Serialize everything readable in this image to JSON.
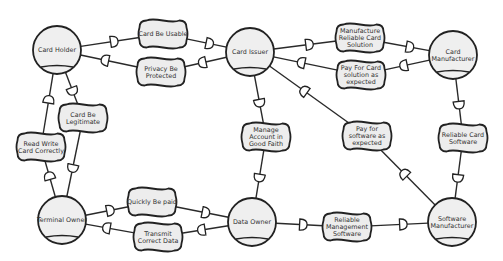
{
  "diagram": {
    "type": "i* Strategic Dependency Model",
    "actors": [
      {
        "id": "card_holder",
        "label": "Card Holder",
        "cx": 57,
        "cy": 50
      },
      {
        "id": "card_issuer",
        "label": "Card Issuer",
        "cx": 250,
        "cy": 52
      },
      {
        "id": "card_manufacturer",
        "label": [
          "Card",
          "Manufacturer"
        ],
        "cx": 453,
        "cy": 55
      },
      {
        "id": "terminal_owner",
        "label": "Terminal Owner",
        "cx": 62,
        "cy": 220
      },
      {
        "id": "data_owner",
        "label": "Data Owner",
        "cx": 252,
        "cy": 222
      },
      {
        "id": "software_manufacturer",
        "label": [
          "Software",
          "Manufacturer"
        ],
        "cx": 452,
        "cy": 222
      }
    ],
    "goals": [
      {
        "id": "card_be_usable",
        "label": [
          "Card Be Usable"
        ],
        "cx": 163,
        "cy": 34
      },
      {
        "id": "privacy_be_protected",
        "label": [
          "Privacy Be",
          "Protected"
        ],
        "cx": 161,
        "cy": 72
      },
      {
        "id": "manufacture_reliable_card_solution",
        "label": [
          "Manufacture",
          "Reliable Card",
          "Solution"
        ],
        "cx": 360,
        "cy": 38
      },
      {
        "id": "pay_for_card_solution",
        "label": [
          "Pay For Card",
          "solution as",
          "expected"
        ],
        "cx": 361,
        "cy": 75
      },
      {
        "id": "card_be_legitimate",
        "label": [
          "Card Be",
          "Legitimate"
        ],
        "cx": 83,
        "cy": 118
      },
      {
        "id": "read_write_card_correctly",
        "label": [
          "Read Write",
          "Card Correctly"
        ],
        "cx": 41,
        "cy": 147
      },
      {
        "id": "manage_account_good_faith",
        "label": [
          "Manage",
          "Account in",
          "Good Faith"
        ],
        "cx": 266,
        "cy": 137
      },
      {
        "id": "pay_for_software",
        "label": [
          "Pay for",
          "software as",
          "expected"
        ],
        "cx": 367,
        "cy": 136
      },
      {
        "id": "reliable_card_software",
        "label": [
          "Reliable Card",
          "Software"
        ],
        "cx": 463,
        "cy": 138
      },
      {
        "id": "quickly_be_paid",
        "label": [
          "Quickly Be paid"
        ],
        "cx": 152,
        "cy": 202
      },
      {
        "id": "transmit_correct_data",
        "label": [
          "Transmit",
          "Correct Data"
        ],
        "cx": 158,
        "cy": 237
      },
      {
        "id": "reliable_management_software",
        "label": [
          "Reliable",
          "Management",
          "Software"
        ],
        "cx": 347,
        "cy": 227
      }
    ],
    "dependencies": [
      {
        "depender": "card_holder",
        "dependum": "card_be_usable",
        "dependee": "card_issuer"
      },
      {
        "depender": "card_issuer",
        "dependum": "privacy_be_protected",
        "dependee": "card_holder"
      },
      {
        "depender": "card_issuer",
        "dependum": "manufacture_reliable_card_solution",
        "dependee": "card_manufacturer"
      },
      {
        "depender": "card_manufacturer",
        "dependum": "pay_for_card_solution",
        "dependee": "card_issuer"
      },
      {
        "depender": "card_holder",
        "dependum": "card_be_legitimate",
        "dependee": "terminal_owner"
      },
      {
        "depender": "terminal_owner",
        "dependum": "read_write_card_correctly",
        "dependee": "card_holder"
      },
      {
        "depender": "card_issuer",
        "dependum": "manage_account_good_faith",
        "dependee": "data_owner"
      },
      {
        "depender": "software_manufacturer",
        "dependum": "pay_for_software",
        "dependee": "card_issuer"
      },
      {
        "depender": "card_manufacturer",
        "dependum": "reliable_card_software",
        "dependee": "software_manufacturer"
      },
      {
        "depender": "terminal_owner",
        "dependum": "quickly_be_paid",
        "dependee": "data_owner"
      },
      {
        "depender": "data_owner",
        "dependum": "transmit_correct_data",
        "dependee": "terminal_owner"
      },
      {
        "depender": "data_owner",
        "dependum": "reliable_management_software",
        "dependee": "software_manufacturer"
      }
    ]
  }
}
